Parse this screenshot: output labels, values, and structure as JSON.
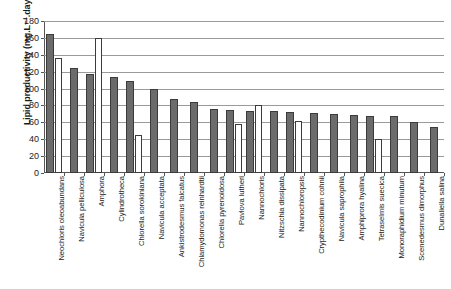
{
  "chart_data": {
    "type": "bar",
    "title": "",
    "xlabel": "",
    "ylabel": "Lipid productivity (mg.L⁻¹.day⁻¹)",
    "ylim": [
      0,
      180
    ],
    "ytick_step": 20,
    "yticks": [
      0,
      20,
      40,
      60,
      80,
      100,
      120,
      140,
      160,
      180
    ],
    "grid": true,
    "legend": "none",
    "categories": [
      "Neochloris oleoabundans",
      "Navicula pelliculosa",
      "Amphora",
      "Cylindrotheca",
      "Chlorella sorokiniana",
      "Navicula acceptata",
      "Ankistrodesmus falcatus",
      "Chlamydomonas reinhardtii",
      "Chlorella pyrenoidosa",
      "Pavlova lutheri",
      "Nannochloris",
      "Nitzschia dissipata",
      "Nannochloropsis",
      "Crypthecodinium cohnii",
      "Navicula saprophila",
      "Amphiprora hyalina",
      "Tetraselmis suecica",
      "Monoraphidium minutum",
      "Scenedesmus dimorphus",
      "Dunaliella salina"
    ],
    "series": [
      {
        "name": "primary",
        "color": "#6b6b6b",
        "values": [
          165,
          124,
          117,
          114,
          109,
          100,
          88,
          84,
          76,
          75,
          73,
          73,
          72,
          71,
          70,
          69,
          68,
          67,
          60,
          54
        ]
      },
      {
        "name": "secondary",
        "color": "#ffffff",
        "values": [
          136,
          null,
          160,
          null,
          45,
          null,
          null,
          null,
          null,
          58,
          80,
          null,
          62,
          null,
          null,
          null,
          40,
          null,
          null,
          null
        ]
      }
    ]
  }
}
